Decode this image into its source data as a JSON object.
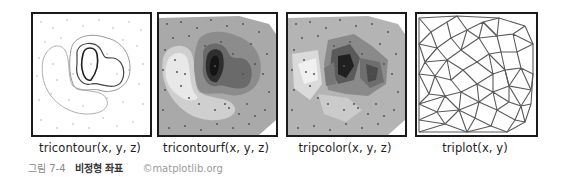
{
  "figure": {
    "caption_number": "그림 7-4",
    "caption_title": "비정형 좌표",
    "credit": "©matplotlib.org"
  },
  "panels": [
    {
      "id": "tricontour",
      "label": "tricontour(x, y, z)"
    },
    {
      "id": "tricontourf",
      "label": "tricontourf(x, y, z)"
    },
    {
      "id": "tripcolor",
      "label": "tripcolor(x, y, z)"
    },
    {
      "id": "triplot",
      "label": "triplot(x, y)"
    }
  ],
  "colors": {
    "frame": "#1a1a1a",
    "contour_dark": "#222222",
    "contour_mid": "#555555",
    "contour_light": "#aaaaaa",
    "fill_bg": "#a8a8a8",
    "fill_light": "#e6e6e6",
    "fill_dark": "#1e1e1e",
    "mesh": "#5a5a5a"
  }
}
